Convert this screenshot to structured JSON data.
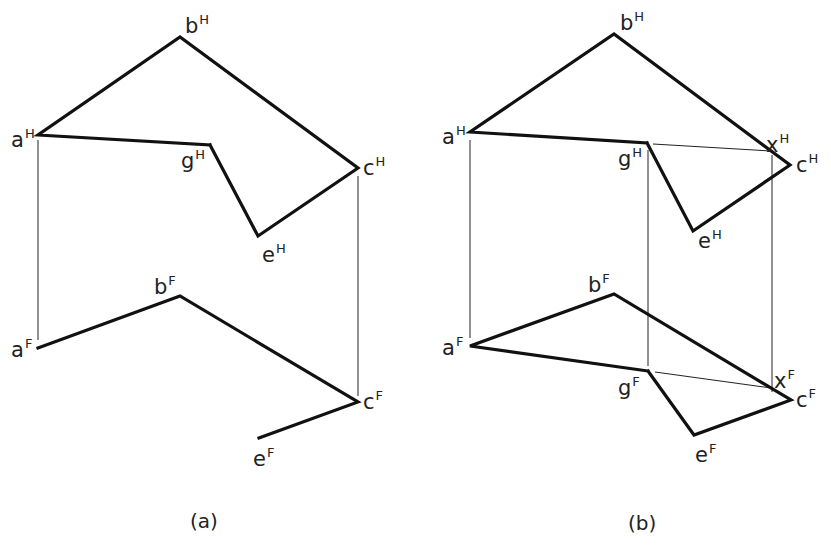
{
  "figure": {
    "panels": [
      {
        "id": "a",
        "caption": "(a)",
        "caption_pos": [
          190,
          528
        ],
        "top_view": {
          "points": {
            "a": [
              38,
              135
            ],
            "b": [
              180,
              37
            ],
            "c": [
              358,
              168
            ],
            "e": [
              258,
              236
            ],
            "g": [
              210,
              145
            ]
          },
          "polyline": [
            "g",
            "a",
            "b",
            "c",
            "e",
            "g"
          ],
          "labels": [
            {
              "base": "a",
              "sup": "H",
              "pos": [
                11,
                147
              ]
            },
            {
              "base": "b",
              "sup": "H",
              "pos": [
                185,
                33
              ]
            },
            {
              "base": "c",
              "sup": "H",
              "pos": [
                363,
                175
              ]
            },
            {
              "base": "e",
              "sup": "H",
              "pos": [
                262,
                262
              ]
            },
            {
              "base": "g",
              "sup": "H",
              "pos": [
                181,
                168
              ]
            }
          ]
        },
        "front_view": {
          "points": {
            "a": [
              38,
              348
            ],
            "b": [
              180,
              296
            ],
            "c": [
              358,
              402
            ],
            "e": [
              259,
              438
            ]
          },
          "polyline": [
            "a",
            "b",
            "c",
            "e"
          ],
          "labels": [
            {
              "base": "a",
              "sup": "F",
              "pos": [
                11,
                357
              ]
            },
            {
              "base": "b",
              "sup": "F",
              "pos": [
                154,
                294
              ]
            },
            {
              "base": "c",
              "sup": "F",
              "pos": [
                363,
                409
              ]
            },
            {
              "base": "e",
              "sup": "F",
              "pos": [
                253,
                466
              ]
            }
          ]
        },
        "projection_lines": [
          {
            "x": 38,
            "y1": 140,
            "y2": 340
          },
          {
            "x": 358,
            "y1": 176,
            "y2": 396
          }
        ],
        "thin_lines": []
      },
      {
        "id": "b",
        "caption": "(b)",
        "caption_pos": [
          628,
          530
        ],
        "top_view": {
          "points": {
            "a": [
              470,
              132
            ],
            "b": [
              614,
              34
            ],
            "c": [
              790,
              165
            ],
            "e": [
              693,
              231
            ],
            "g": [
              647,
              143
            ],
            "x": [
              771,
              150
            ]
          },
          "polyline": [
            "g",
            "a",
            "b",
            "c",
            "e",
            "g"
          ],
          "labels": [
            {
              "base": "a",
              "sup": "H",
              "pos": [
                442,
                144
              ]
            },
            {
              "base": "b",
              "sup": "H",
              "pos": [
                620,
                30
              ]
            },
            {
              "base": "c",
              "sup": "H",
              "pos": [
                796,
                172
              ]
            },
            {
              "base": "e",
              "sup": "H",
              "pos": [
                698,
                248
              ]
            },
            {
              "base": "g",
              "sup": "H",
              "pos": [
                618,
                166
              ]
            },
            {
              "base": "x",
              "sup": "H",
              "pos": [
                766,
                152
              ]
            }
          ]
        },
        "front_view": {
          "points": {
            "a": [
              470,
              346
            ],
            "b": [
              614,
              294
            ],
            "c": [
              791,
              400
            ],
            "e": [
              694,
              435
            ],
            "g": [
              648,
              371
            ],
            "x": [
              771,
              388
            ]
          },
          "polyline": [
            "g",
            "a",
            "b",
            "c",
            "e",
            "g"
          ],
          "labels": [
            {
              "base": "a",
              "sup": "F",
              "pos": [
                442,
                355
              ]
            },
            {
              "base": "b",
              "sup": "F",
              "pos": [
                588,
                292
              ]
            },
            {
              "base": "c",
              "sup": "F",
              "pos": [
                796,
                407
              ]
            },
            {
              "base": "e",
              "sup": "F",
              "pos": [
                695,
                462
              ]
            },
            {
              "base": "g",
              "sup": "F",
              "pos": [
                618,
                395
              ]
            },
            {
              "base": "x",
              "sup": "F",
              "pos": [
                774,
                388
              ]
            }
          ]
        },
        "projection_lines": [
          {
            "x": 470,
            "y1": 140,
            "y2": 338
          },
          {
            "x": 648,
            "y1": 150,
            "y2": 366
          },
          {
            "x": 772,
            "y1": 155,
            "y2": 392
          }
        ],
        "thin_lines": [
          {
            "from": [
              653,
              144
            ],
            "to": [
              771,
              151
            ]
          },
          {
            "from": [
              655,
              372
            ],
            "to": [
              771,
              388
            ]
          }
        ]
      }
    ]
  }
}
